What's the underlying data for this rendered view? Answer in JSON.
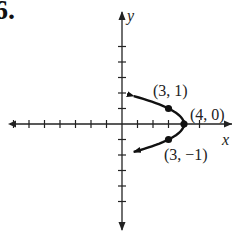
{
  "problem": {
    "number": "6."
  },
  "chart_data": {
    "type": "line",
    "title": "",
    "xlabel": "x",
    "ylabel": "y",
    "equation_implied": "x = 4 - y^2",
    "xlim": [
      -8,
      5
    ],
    "ylim": [
      -5,
      5
    ],
    "x_ticks": [
      -7,
      -6,
      -5,
      -4,
      -3,
      -2,
      -1,
      1,
      2,
      3,
      4,
      5
    ],
    "y_ticks": [
      -5,
      -4,
      -3,
      -2,
      -1,
      1,
      2,
      3,
      4,
      5
    ],
    "grid": false,
    "series": [
      {
        "name": "parabola",
        "points": [
          {
            "x": 0.76,
            "y": 1.8
          },
          {
            "x": 3,
            "y": 1
          },
          {
            "x": 4,
            "y": 0
          },
          {
            "x": 3,
            "y": -1
          },
          {
            "x": 0.76,
            "y": -1.8
          }
        ],
        "arrows_at_ends": true
      }
    ],
    "annotations": [
      {
        "text": "(3, 1)",
        "x": 3,
        "y": 1
      },
      {
        "text": "(4, 0)",
        "x": 4,
        "y": 0
      },
      {
        "text": "(3, −1)",
        "x": 3,
        "y": -1
      }
    ]
  }
}
